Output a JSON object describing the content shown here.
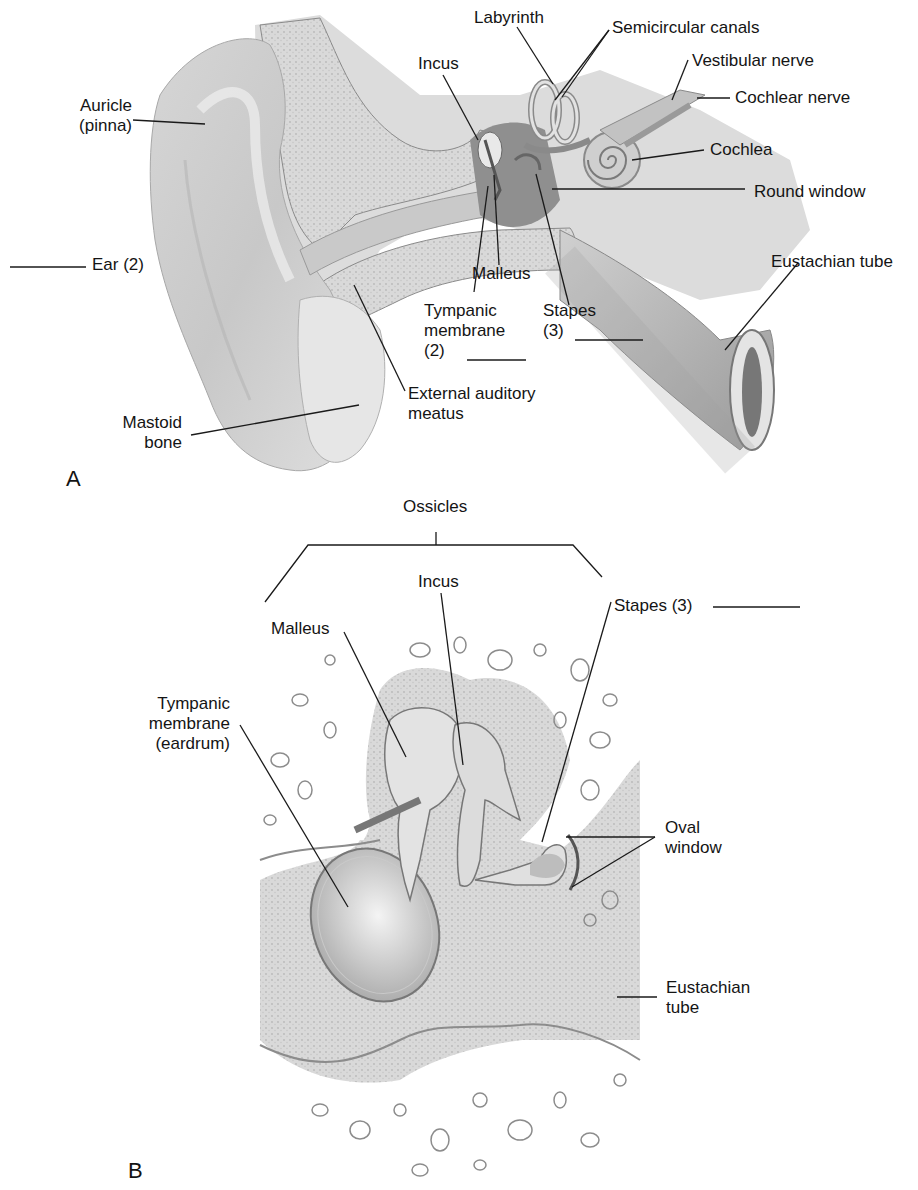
{
  "figure": {
    "panels": [
      {
        "id": "A",
        "letter": "A",
        "description": "Cross-section of the whole ear: external, middle and inner ear",
        "labels": {
          "auricle_1": "Auricle",
          "auricle_2": "(pinna)",
          "ear": "Ear (2)",
          "incus": "Incus",
          "labyrinth": "Labyrinth",
          "semicircular_canals": "Semicircular canals",
          "vestibular_nerve": "Vestibular nerve",
          "cochlear_nerve": "Cochlear nerve",
          "cochlea": "Cochlea",
          "round_window": "Round window",
          "eustachian_tube": "Eustachian tube",
          "malleus": "Malleus",
          "tympanic_1": "Tympanic",
          "tympanic_2": "membrane",
          "tympanic_3": "(2)",
          "stapes_1": "Stapes",
          "stapes_2": "(3)",
          "external_1": "External auditory",
          "external_2": "meatus",
          "mastoid_1": "Mastoid",
          "mastoid_2": "bone"
        }
      },
      {
        "id": "B",
        "letter": "B",
        "description": "Enlarged view of the middle ear ossicles",
        "labels": {
          "ossicles": "Ossicles",
          "incus": "Incus",
          "malleus": "Malleus",
          "stapes": "Stapes (3)",
          "tympanic_1": "Tympanic",
          "tympanic_2": "membrane",
          "tympanic_3": "(eardrum)",
          "oval_1": "Oval",
          "oval_2": "window",
          "eustachian_1": "Eustachian",
          "eustachian_2": "tube"
        }
      }
    ],
    "blanks": [
      "Ear (2)",
      "Tympanic membrane (2)",
      "Stapes (3)",
      "Stapes (3) panel B"
    ]
  }
}
